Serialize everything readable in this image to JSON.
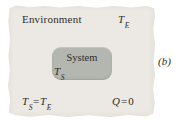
{
  "panel_label": "(b)",
  "environment": {
    "label": "Environment",
    "temperature": {
      "symbol": "T",
      "subscript": "E"
    }
  },
  "system": {
    "label": "System",
    "temperature": {
      "symbol": "T",
      "subscript": "S"
    }
  },
  "equations": {
    "temperature_equality": {
      "lhs_symbol": "T",
      "lhs_sub": "S",
      "equals": "=",
      "rhs_symbol": "T",
      "rhs_sub": "E"
    },
    "heat": {
      "symbol": "Q",
      "equals": "=",
      "value": "0"
    }
  },
  "colors": {
    "environment_bg": "#ece9e4",
    "system_bg": "#b4b7b0",
    "text": "#2e2c29"
  }
}
